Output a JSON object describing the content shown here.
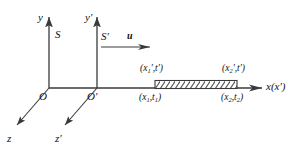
{
  "figure": {
    "background_color": "#ffffff",
    "line_color": "#3a3a3a",
    "text_color": "#111111",
    "hatch_color": "#555555",
    "axes": {
      "y_label": "y",
      "y_prime_label": "y′",
      "x_label": "x(x′)",
      "z_label": "z",
      "z_prime_label": "z′"
    },
    "frames": {
      "rest_frame_label": "S",
      "moving_frame_label": "S′",
      "velocity_label": "u"
    },
    "origins": {
      "origin_label": "O",
      "origin_prime_label": "O′"
    },
    "rod": {
      "left_top_label": "(x",
      "left_top_sub": "1",
      "left_top_rest": "′,t′)",
      "left_bottom_label": "(x",
      "left_bottom_sub": "1",
      "left_bottom_mid": ",t",
      "left_bottom_sub2": "1",
      "left_bottom_end": ")",
      "right_top_label": "(x",
      "right_top_sub": "2",
      "right_top_rest": "′,t′)",
      "right_bottom_label": "(x",
      "right_bottom_sub": "2",
      "right_bottom_mid": ",t",
      "right_bottom_sub2": "2",
      "right_bottom_end": ")"
    }
  }
}
